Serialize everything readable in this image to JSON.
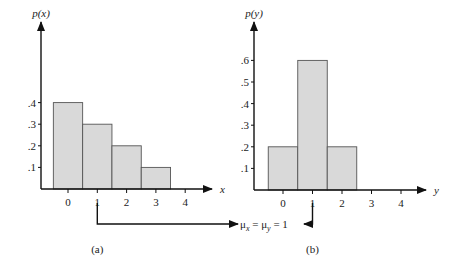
{
  "chart_data": [
    {
      "type": "bar",
      "panel_label": "(a)",
      "xlabel": "x",
      "ylabel": "p(x)",
      "categories": [
        "0",
        "1",
        "2",
        "3",
        "4"
      ],
      "values": [
        0.4,
        0.3,
        0.2,
        0.1,
        0
      ],
      "y_ticks": [
        ".1",
        ".2",
        ".3",
        ".4"
      ],
      "x_ticks": [
        "0",
        "1",
        "2",
        "3",
        "4"
      ],
      "ylim": [
        0,
        0.7
      ],
      "grid": false,
      "mean": 1
    },
    {
      "type": "bar",
      "panel_label": "(b)",
      "xlabel": "y",
      "ylabel": "p(y)",
      "categories": [
        "0",
        "1",
        "2",
        "3",
        "4"
      ],
      "values": [
        0.2,
        0.6,
        0.2,
        0,
        0
      ],
      "y_ticks": [
        ".1",
        ".2",
        ".3",
        ".4",
        ".5",
        ".6"
      ],
      "x_ticks": [
        "0",
        "1",
        "2",
        "3",
        "4"
      ],
      "ylim": [
        0,
        0.7
      ],
      "grid": false,
      "mean": 1
    }
  ],
  "annotation": {
    "text": "μx = μy = 1",
    "mu": "μ",
    "sub_x": "x",
    "sub_y": "y",
    "eq": "=",
    "value": "1"
  }
}
